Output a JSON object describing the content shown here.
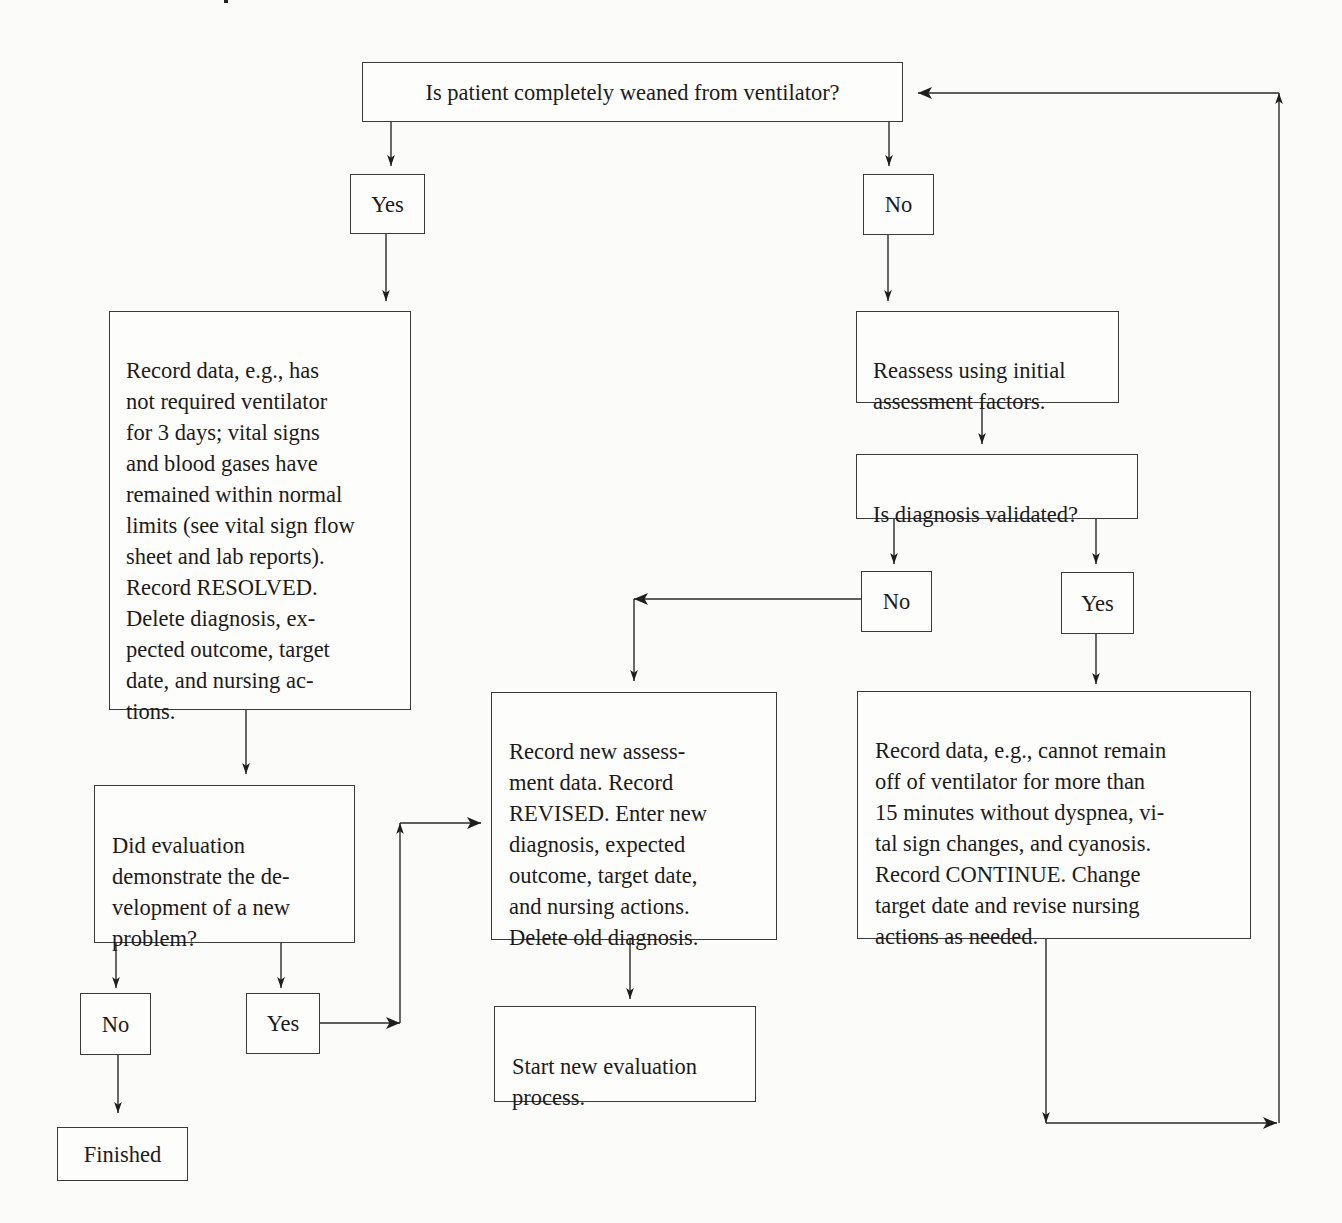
{
  "diagram": {
    "type": "flowchart",
    "nodes": {
      "q_weaned": {
        "text": "Is patient completely weaned from ventilator?"
      },
      "yes_weaned": {
        "text": "Yes"
      },
      "no_weaned": {
        "text": "No"
      },
      "record_resolved": {
        "text": "Record data, e.g., has\nnot required ventilator\nfor 3 days; vital signs\nand blood gases have\nremained within normal\nlimits (see vital sign flow\nsheet and lab reports).\nRecord RESOLVED.\nDelete diagnosis, ex-\npected outcome, target\ndate, and nursing ac-\ntions."
      },
      "reassess": {
        "text": "Reassess using initial\nassessment factors."
      },
      "q_validated": {
        "text": "Is diagnosis validated?"
      },
      "no_validated": {
        "text": "No"
      },
      "yes_validated": {
        "text": "Yes"
      },
      "record_revised": {
        "text": "Record new assess-\nment data. Record\nREVISED. Enter new\ndiagnosis, expected\noutcome, target date,\nand nursing actions.\nDelete old diagnosis."
      },
      "record_continue": {
        "text": "Record data, e.g., cannot remain\noff of ventilator for more than\n15 minutes without dyspnea, vi-\ntal sign changes, and cyanosis.\nRecord CONTINUE. Change\ntarget date and revise nursing\nactions as needed."
      },
      "q_new_problem": {
        "text": "Did evaluation\ndemonstrate the de-\nvelopment of a new\nproblem?"
      },
      "no_new_problem": {
        "text": "No"
      },
      "yes_new_problem": {
        "text": "Yes"
      },
      "start_new": {
        "text": "Start new evaluation\nprocess."
      },
      "finished": {
        "text": "Finished"
      }
    },
    "edges": [
      [
        "q_weaned",
        "yes_weaned"
      ],
      [
        "q_weaned",
        "no_weaned"
      ],
      [
        "yes_weaned",
        "record_resolved"
      ],
      [
        "no_weaned",
        "reassess"
      ],
      [
        "reassess",
        "q_validated"
      ],
      [
        "q_validated",
        "no_validated"
      ],
      [
        "q_validated",
        "yes_validated"
      ],
      [
        "no_validated",
        "record_revised"
      ],
      [
        "yes_validated",
        "record_continue"
      ],
      [
        "record_continue",
        "q_weaned"
      ],
      [
        "record_resolved",
        "q_new_problem"
      ],
      [
        "q_new_problem",
        "no_new_problem"
      ],
      [
        "q_new_problem",
        "yes_new_problem"
      ],
      [
        "yes_new_problem",
        "record_revised"
      ],
      [
        "no_new_problem",
        "finished"
      ],
      [
        "record_revised",
        "start_new"
      ]
    ],
    "colors": {
      "line": "#2a2a2a",
      "background": "#fbfbfa",
      "text": "#1b1b1b"
    }
  }
}
